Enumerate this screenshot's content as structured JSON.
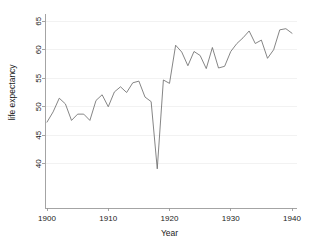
{
  "chart_data": {
    "type": "line",
    "title": "",
    "subtitle": "",
    "xlabel": "Year",
    "ylabel": "life expectancy",
    "xlim": [
      1900,
      1940
    ],
    "ylim": [
      38.5,
      66
    ],
    "xticks": [
      1900,
      1910,
      1920,
      1930,
      1940
    ],
    "xtick_labels": [
      "1900",
      "1910",
      "1920",
      "1930",
      "1940"
    ],
    "yticks": [
      40,
      45,
      50,
      55,
      60,
      65
    ],
    "ytick_labels": [
      "40",
      "45",
      "50",
      "55",
      "60",
      "65"
    ],
    "grid": true,
    "legend": "none",
    "line_color": "#6f6f6f",
    "background_color": "#ffffff",
    "series": [
      {
        "name": "life expectancy",
        "x": [
          1900,
          1901,
          1902,
          1903,
          1904,
          1905,
          1906,
          1907,
          1908,
          1909,
          1910,
          1911,
          1912,
          1913,
          1914,
          1915,
          1916,
          1917,
          1918,
          1919,
          1920,
          1921,
          1922,
          1923,
          1924,
          1925,
          1926,
          1927,
          1928,
          1929,
          1930,
          1931,
          1932,
          1933,
          1934,
          1935,
          1936,
          1937,
          1938,
          1939,
          1940
        ],
        "values": [
          47.3,
          49.1,
          51.5,
          50.5,
          47.6,
          48.7,
          48.7,
          47.6,
          51.1,
          52.1,
          50.0,
          52.6,
          53.5,
          52.5,
          54.2,
          54.5,
          51.7,
          50.9,
          39.1,
          54.7,
          54.1,
          60.8,
          59.6,
          57.2,
          59.7,
          59.0,
          56.7,
          60.4,
          56.8,
          57.1,
          59.7,
          61.1,
          62.1,
          63.3,
          61.1,
          61.7,
          58.5,
          60.0,
          63.5,
          63.7,
          62.9
        ]
      }
    ]
  },
  "axes": {
    "y_axis_title": "life expectancy",
    "x_axis_title": "Year"
  }
}
